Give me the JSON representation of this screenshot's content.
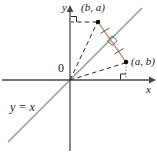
{
  "figure": {
    "background": "#ffffff",
    "width": 157,
    "height": 153,
    "axes": {
      "x_label": "x",
      "y_label": "y",
      "origin_label": "0",
      "axis_color": "#4a4a4a",
      "x_axis_y": 80,
      "y_axis_x": 70
    },
    "line": {
      "label": "y = x",
      "color": "#86a18c",
      "equation": "y = x"
    },
    "points": [
      {
        "name": "point-ba",
        "label": "(b, a)",
        "px": 98,
        "py": 22,
        "color": "#111111"
      },
      {
        "name": "point-ab",
        "label": "(a, b)",
        "px": 126,
        "py": 62,
        "color": "#111111"
      }
    ],
    "segment": {
      "name": "reflection-segment",
      "color": "#c89a82",
      "from": "(b, a)",
      "to": "(a, b)",
      "tick_marks": 2,
      "right_angle_at_intersection": true
    },
    "dashed_lines": [
      {
        "name": "dashed-origin-to-ba",
        "from": "0",
        "to": "(b, a)"
      },
      {
        "name": "dashed-origin-to-ab",
        "from": "0",
        "to": "(a, b)"
      },
      {
        "name": "dashed-ba-to-y-axis",
        "from": "(b, a)",
        "to": "y-axis"
      },
      {
        "name": "dashed-ab-to-x-axis",
        "from": "(a, b)",
        "to": "x-axis"
      }
    ],
    "right_angle_marks": [
      {
        "name": "right-angle-y-axis",
        "x": 71,
        "y": 18
      },
      {
        "name": "right-angle-x-axis",
        "x": 120,
        "y": 73
      },
      {
        "name": "right-angle-intersection",
        "x": 106,
        "y": 42
      }
    ]
  }
}
